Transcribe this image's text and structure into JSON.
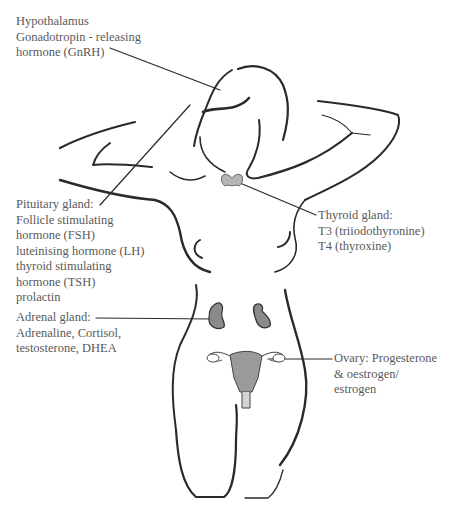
{
  "diagram": {
    "type": "labeled anatomical illustration",
    "colors": {
      "ink": "#2a2a2a",
      "text": "#5a5a5a",
      "organ_fill": "#8a8a8a"
    }
  },
  "labels": {
    "hypothalamus": {
      "lines": [
        "Hypothalamus",
        "Gonadotropin - releasing",
        "hormone (GnRH)"
      ]
    },
    "pituitary": {
      "lines": [
        "Pituitary gland:",
        "Follicle stimulating",
        "hormone (FSH)",
        "luteinising hormone (LH)",
        "thyroid stimulating",
        "hormone (TSH)",
        "prolactin"
      ]
    },
    "thyroid": {
      "lines": [
        "Thyroid gland:",
        "T3 (triiodothyronine)",
        "T4 (thyroxine)"
      ]
    },
    "adrenal": {
      "lines": [
        "Adrenal gland:",
        "Adrenaline, Cortisol,",
        "testosterone, DHEA"
      ]
    },
    "ovary": {
      "lines": [
        "Ovary: Progesterone",
        "& oestrogen/",
        "estrogen"
      ]
    }
  }
}
